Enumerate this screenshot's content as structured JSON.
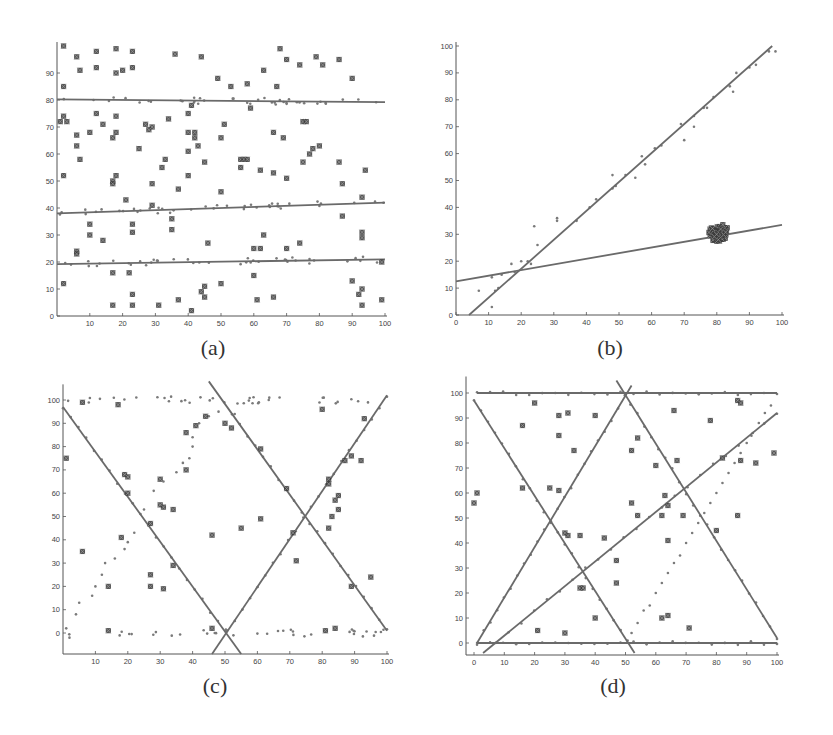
{
  "figure": {
    "captions": [
      "(a)",
      "(b)",
      "(c)",
      "(d)"
    ]
  },
  "colors": {
    "line": "#6a6a6a",
    "inlier": "#7a7a7a",
    "outlier": "#3a3a3a",
    "axis": "#555555"
  },
  "chart_data": [
    {
      "id": "a",
      "type": "scatter",
      "title": "(a)",
      "xlabel": "",
      "ylabel": "",
      "xlim": [
        0,
        100
      ],
      "ylim": [
        0,
        100
      ],
      "xticks": [
        10,
        20,
        30,
        40,
        50,
        60,
        70,
        80,
        90,
        100
      ],
      "yticks": [
        0,
        10,
        20,
        30,
        40,
        50,
        60,
        70,
        80,
        90
      ],
      "frame": {
        "x0": 57,
        "x1": 385,
        "y0": 316,
        "y100": 46
      },
      "fitted_lines": [
        {
          "x1": 0,
          "y1": 80.2,
          "x2": 100,
          "y2": 79.2
        },
        {
          "x1": 0,
          "y1": 38.0,
          "x2": 100,
          "y2": 42.0
        },
        {
          "x1": 0,
          "y1": 19.2,
          "x2": 100,
          "y2": 21.0
        }
      ],
      "inliers_per_line": 40,
      "inlier_noise": 1.2,
      "outliers": [
        [
          2,
          100
        ],
        [
          2,
          85
        ],
        [
          1,
          72
        ],
        [
          2,
          74
        ],
        [
          3,
          72
        ],
        [
          2,
          52
        ],
        [
          2,
          12
        ],
        [
          6,
          96
        ],
        [
          7,
          91
        ],
        [
          6,
          67
        ],
        [
          6,
          63
        ],
        [
          7,
          58
        ],
        [
          6,
          24
        ],
        [
          6,
          23
        ],
        [
          10,
          68
        ],
        [
          10,
          34
        ],
        [
          10,
          30
        ],
        [
          12,
          98
        ],
        [
          12,
          92
        ],
        [
          12,
          75
        ],
        [
          14,
          71
        ],
        [
          14,
          28
        ],
        [
          17,
          66
        ],
        [
          17,
          50
        ],
        [
          17,
          49
        ],
        [
          17,
          16
        ],
        [
          17,
          4
        ],
        [
          18,
          99
        ],
        [
          18,
          90
        ],
        [
          18,
          74
        ],
        [
          18,
          68
        ],
        [
          18,
          52
        ],
        [
          20,
          91
        ],
        [
          21,
          43
        ],
        [
          22,
          16
        ],
        [
          23,
          98
        ],
        [
          23,
          92
        ],
        [
          23,
          34
        ],
        [
          23,
          31
        ],
        [
          23,
          8
        ],
        [
          23,
          4
        ],
        [
          25,
          62
        ],
        [
          27,
          71
        ],
        [
          28,
          69
        ],
        [
          29,
          70
        ],
        [
          29,
          49
        ],
        [
          29,
          41
        ],
        [
          31,
          4
        ],
        [
          32,
          55
        ],
        [
          33,
          58
        ],
        [
          34,
          73
        ],
        [
          35,
          32
        ],
        [
          35,
          36
        ],
        [
          36,
          97
        ],
        [
          37,
          47
        ],
        [
          37,
          6
        ],
        [
          40,
          68
        ],
        [
          40,
          61
        ],
        [
          40,
          52
        ],
        [
          40,
          75
        ],
        [
          41,
          78
        ],
        [
          42,
          68
        ],
        [
          42,
          66
        ],
        [
          43,
          63
        ],
        [
          44,
          96
        ],
        [
          44,
          9
        ],
        [
          45,
          57
        ],
        [
          45,
          7
        ],
        [
          45,
          11
        ],
        [
          46,
          27
        ],
        [
          41,
          2
        ],
        [
          49,
          88
        ],
        [
          50,
          66
        ],
        [
          51,
          71
        ],
        [
          50,
          46
        ],
        [
          50,
          12
        ],
        [
          53,
          85
        ],
        [
          56,
          58
        ],
        [
          57,
          58
        ],
        [
          58,
          58
        ],
        [
          56,
          55
        ],
        [
          58,
          86
        ],
        [
          59,
          77
        ],
        [
          60,
          25
        ],
        [
          60,
          15
        ],
        [
          61,
          6
        ],
        [
          62,
          54
        ],
        [
          62,
          25
        ],
        [
          63,
          91
        ],
        [
          63,
          30
        ],
        [
          66,
          68
        ],
        [
          66,
          53
        ],
        [
          66,
          7
        ],
        [
          67,
          85
        ],
        [
          68,
          99
        ],
        [
          69,
          66
        ],
        [
          70,
          95
        ],
        [
          70,
          51
        ],
        [
          70,
          25
        ],
        [
          74,
          93
        ],
        [
          74,
          27
        ],
        [
          75,
          72
        ],
        [
          76,
          72
        ],
        [
          75,
          57
        ],
        [
          77,
          60
        ],
        [
          78,
          62
        ],
        [
          79,
          96
        ],
        [
          80,
          63
        ],
        [
          81,
          93
        ],
        [
          86,
          95
        ],
        [
          86,
          57
        ],
        [
          87,
          49
        ],
        [
          87,
          37
        ],
        [
          90,
          88
        ],
        [
          90,
          13
        ],
        [
          92,
          8
        ],
        [
          93,
          44
        ],
        [
          93,
          31
        ],
        [
          93,
          29
        ],
        [
          94,
          54
        ],
        [
          93,
          10
        ],
        [
          93,
          4
        ],
        [
          99,
          6
        ],
        [
          99,
          20
        ]
      ]
    },
    {
      "id": "b",
      "type": "scatter",
      "title": "(b)",
      "xlabel": "",
      "ylabel": "",
      "xlim": [
        0,
        100
      ],
      "ylim": [
        0,
        100
      ],
      "xticks": [
        0,
        10,
        20,
        30,
        40,
        50,
        60,
        70,
        80,
        90,
        100
      ],
      "yticks": [
        0,
        10,
        20,
        30,
        40,
        50,
        60,
        70,
        80,
        90,
        100
      ],
      "frame": {
        "x0": 456,
        "x1": 782,
        "y0": 315,
        "y100": 46
      },
      "fitted_lines": [
        {
          "x1": 4,
          "y1": 0,
          "x2": 97,
          "y2": 100
        },
        {
          "x1": 0,
          "y1": 12.5,
          "x2": 100,
          "y2": 33.5
        }
      ],
      "inlier_points": [
        [
          7,
          9
        ],
        [
          11,
          3
        ],
        [
          12,
          9
        ],
        [
          13,
          10
        ],
        [
          17,
          19
        ],
        [
          18,
          16
        ],
        [
          20,
          20
        ],
        [
          22,
          20
        ],
        [
          23,
          19
        ],
        [
          24,
          33
        ],
        [
          25,
          26
        ],
        [
          31,
          35
        ],
        [
          31,
          36
        ],
        [
          37,
          35
        ],
        [
          41,
          40
        ],
        [
          43,
          43
        ],
        [
          48,
          47
        ],
        [
          48,
          52
        ],
        [
          49,
          48
        ],
        [
          52,
          52
        ],
        [
          55,
          51
        ],
        [
          57,
          59
        ],
        [
          58,
          56
        ],
        [
          61,
          62
        ],
        [
          63,
          63
        ],
        [
          69,
          71
        ],
        [
          70,
          65
        ],
        [
          73,
          70
        ],
        [
          73,
          74
        ],
        [
          76,
          77
        ],
        [
          77,
          77
        ],
        [
          79,
          81
        ],
        [
          84,
          85
        ],
        [
          85,
          83
        ],
        [
          86,
          90
        ],
        [
          90,
          92
        ],
        [
          92,
          93
        ],
        [
          96,
          98
        ],
        [
          98,
          98
        ],
        [
          11,
          14
        ],
        [
          14,
          15
        ]
      ],
      "outlier_cluster": {
        "center": [
          80.5,
          30.5
        ],
        "count": 60,
        "spread": [
          2.2,
          2.2
        ]
      }
    },
    {
      "id": "c",
      "type": "scatter",
      "title": "(c)",
      "xlabel": "",
      "ylabel": "",
      "xlim": [
        0,
        100
      ],
      "ylim": [
        -10,
        105
      ],
      "xticks": [
        10,
        20,
        30,
        40,
        50,
        60,
        70,
        80,
        90,
        100
      ],
      "yticks": [
        0,
        10,
        20,
        30,
        40,
        50,
        60,
        70,
        80,
        90,
        100
      ],
      "frame": {
        "x0": 63,
        "x1": 387,
        "y0": 633,
        "y100": 400,
        "ybottom": 654
      },
      "fitted_lines": [
        {
          "x1": 0,
          "y1": 97,
          "x2": 55,
          "y2": -9
        },
        {
          "x1": 46,
          "y1": -9,
          "x2": 100,
          "y2": 102
        },
        {
          "x1": 45,
          "y1": 108,
          "x2": 100,
          "y2": 1
        }
      ],
      "horizontal_dot_rows": [
        100,
        0
      ],
      "curve_points": [
        [
          1,
          2
        ],
        [
          2,
          -2
        ],
        [
          4,
          8
        ],
        [
          5,
          13
        ],
        [
          9,
          16
        ],
        [
          10,
          20
        ],
        [
          12,
          25
        ],
        [
          13,
          30
        ],
        [
          16,
          32
        ],
        [
          19,
          36
        ],
        [
          20,
          39
        ],
        [
          22,
          43
        ],
        [
          25,
          53
        ],
        [
          28,
          61
        ],
        [
          31,
          65
        ],
        [
          35,
          69
        ],
        [
          37,
          73
        ],
        [
          39,
          75
        ],
        [
          40,
          80
        ],
        [
          40,
          84
        ],
        [
          42,
          90
        ],
        [
          45,
          93
        ],
        [
          48,
          95
        ],
        [
          53,
          94
        ]
      ],
      "outliers": [
        [
          1,
          75
        ],
        [
          6,
          35
        ],
        [
          6,
          99
        ],
        [
          14,
          20
        ],
        [
          14,
          1
        ],
        [
          17,
          98
        ],
        [
          18,
          41
        ],
        [
          19,
          68
        ],
        [
          20,
          67
        ],
        [
          20,
          60
        ],
        [
          27,
          47
        ],
        [
          27,
          25
        ],
        [
          27,
          20
        ],
        [
          30,
          66
        ],
        [
          30,
          55
        ],
        [
          31,
          54
        ],
        [
          31,
          19
        ],
        [
          34,
          53
        ],
        [
          34,
          29
        ],
        [
          38,
          86
        ],
        [
          38,
          70
        ],
        [
          41,
          89
        ],
        [
          44,
          93
        ],
        [
          46,
          42
        ],
        [
          46,
          2
        ],
        [
          50,
          90
        ],
        [
          52,
          88
        ],
        [
          55,
          45
        ],
        [
          61,
          49
        ],
        [
          61,
          79
        ],
        [
          69,
          62
        ],
        [
          71,
          43
        ],
        [
          72,
          31
        ],
        [
          80,
          96
        ],
        [
          81,
          1
        ],
        [
          82,
          66
        ],
        [
          82,
          64
        ],
        [
          82,
          45
        ],
        [
          83,
          50
        ],
        [
          84,
          57
        ],
        [
          84,
          2
        ],
        [
          85,
          53
        ],
        [
          85,
          59
        ],
        [
          87,
          74
        ],
        [
          89,
          76
        ],
        [
          89,
          20
        ],
        [
          92,
          74
        ],
        [
          93,
          92
        ],
        [
          95,
          24
        ]
      ]
    },
    {
      "id": "d",
      "type": "scatter",
      "title": "(d)",
      "xlabel": "",
      "ylabel": "",
      "xlim": [
        -3,
        103
      ],
      "ylim": [
        -5,
        105
      ],
      "xticks": [
        0,
        10,
        20,
        30,
        40,
        50,
        60,
        70,
        80,
        90,
        100
      ],
      "yticks": [
        0,
        10,
        20,
        30,
        40,
        50,
        60,
        70,
        80,
        90,
        100
      ],
      "frame": {
        "x0": 474,
        "x1": 777,
        "y0": 643,
        "y100": 393,
        "xaxis_y": 655,
        "yaxis_x": 466
      },
      "fitted_lines": [
        {
          "x1": 1,
          "y1": 100,
          "x2": 100,
          "y2": 100
        },
        {
          "x1": 1,
          "y1": 0,
          "x2": 100,
          "y2": 0
        },
        {
          "x1": 1,
          "y1": 0,
          "x2": 52,
          "y2": 103
        },
        {
          "x1": 0,
          "y1": 97,
          "x2": 53,
          "y2": -4
        },
        {
          "x1": 47,
          "y1": 105,
          "x2": 100,
          "y2": 2
        },
        {
          "x1": 3,
          "y1": -4,
          "x2": 100,
          "y2": 92
        }
      ],
      "curve_points": [
        [
          52,
          4
        ],
        [
          54,
          8
        ],
        [
          56,
          13
        ],
        [
          58,
          15
        ],
        [
          60,
          20
        ],
        [
          62,
          24
        ],
        [
          64,
          28
        ],
        [
          66,
          32
        ],
        [
          68,
          35
        ],
        [
          70,
          40
        ],
        [
          72,
          44
        ],
        [
          74,
          48
        ],
        [
          76,
          52
        ],
        [
          78,
          56
        ],
        [
          80,
          60
        ],
        [
          82,
          64
        ],
        [
          84,
          68
        ],
        [
          86,
          72
        ],
        [
          88,
          76
        ],
        [
          90,
          80
        ],
        [
          92,
          84
        ],
        [
          94,
          88
        ],
        [
          96,
          92
        ],
        [
          98,
          95
        ]
      ],
      "outliers": [
        [
          0,
          56
        ],
        [
          1,
          60
        ],
        [
          16,
          87
        ],
        [
          16,
          62
        ],
        [
          20,
          96
        ],
        [
          21,
          5
        ],
        [
          25,
          62
        ],
        [
          28,
          91
        ],
        [
          28,
          83
        ],
        [
          28,
          61
        ],
        [
          30,
          44
        ],
        [
          30,
          4
        ],
        [
          31,
          92
        ],
        [
          31,
          43
        ],
        [
          33,
          77
        ],
        [
          35,
          43
        ],
        [
          35,
          22
        ],
        [
          36,
          22
        ],
        [
          40,
          91
        ],
        [
          40,
          10
        ],
        [
          43,
          42
        ],
        [
          47,
          33
        ],
        [
          47,
          24
        ],
        [
          52,
          56
        ],
        [
          52,
          77
        ],
        [
          54,
          82
        ],
        [
          54,
          51
        ],
        [
          60,
          71
        ],
        [
          62,
          51
        ],
        [
          62,
          10
        ],
        [
          63,
          59
        ],
        [
          64,
          55
        ],
        [
          64,
          41
        ],
        [
          64,
          11
        ],
        [
          66,
          93
        ],
        [
          67,
          73
        ],
        [
          69,
          51
        ],
        [
          71,
          6
        ],
        [
          78,
          89
        ],
        [
          80,
          45
        ],
        [
          82,
          74
        ],
        [
          87,
          97
        ],
        [
          87,
          51
        ],
        [
          88,
          96
        ],
        [
          88,
          73
        ],
        [
          93,
          72
        ],
        [
          99,
          76
        ]
      ]
    }
  ]
}
